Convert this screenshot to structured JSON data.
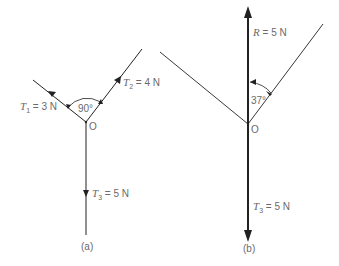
{
  "figure_a": {
    "caption": "(a)",
    "origin_label": "O",
    "angle_label": "90°",
    "forces": [
      {
        "symbol": "T",
        "sub": "1",
        "value": "= 3 N"
      },
      {
        "symbol": "T",
        "sub": "2",
        "value": "= 4 N"
      },
      {
        "symbol": "T",
        "sub": "3",
        "value": "= 5 N"
      }
    ]
  },
  "figure_b": {
    "caption": "(b)",
    "origin_label": "O",
    "angle_label": "37°",
    "forces": [
      {
        "symbol": "R",
        "sub": "",
        "value": "= 5 N"
      },
      {
        "symbol": "T",
        "sub": "3",
        "value": "= 5 N"
      }
    ]
  },
  "colors": {
    "line": "#222222",
    "text": "#6a6a6a"
  }
}
